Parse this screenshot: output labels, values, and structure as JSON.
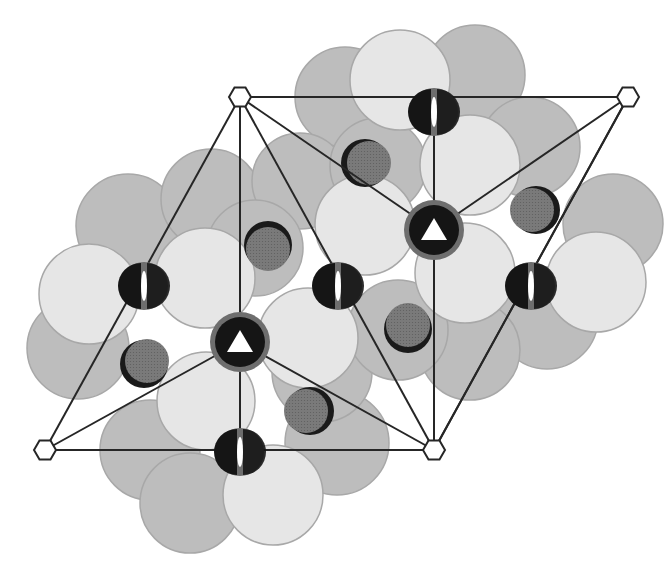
{
  "diagram": {
    "title": "Hexagonal crystal structure projection with symmetry elements",
    "type": "crystal-structure-projection",
    "colors": {
      "background": "#ffffff",
      "large_sphere_light": "#e6e6e6",
      "large_sphere_dark": "#bdbdbd",
      "large_sphere_stroke": "#a8a8a8",
      "medium_sphere": "#7a7a7a",
      "medium_sphere_shadow": "#1a1a1a",
      "axis_disc_outer": "#6e6e6e",
      "axis_disc_inner": "#151515",
      "cell_line": "#262626",
      "symbol_fill": "#ffffff"
    },
    "unit_cell": {
      "vertices": [
        {
          "name": "top-left",
          "x": 240,
          "y": 97
        },
        {
          "name": "top-right",
          "x": 628,
          "y": 97
        },
        {
          "name": "bottom-left",
          "x": 45,
          "y": 450
        },
        {
          "name": "bottom-right",
          "x": 434,
          "y": 450
        }
      ]
    },
    "symmetry_elements": {
      "sixfold_axes": [
        {
          "x": 240,
          "y": 97
        },
        {
          "x": 628,
          "y": 97
        },
        {
          "x": 45,
          "y": 450
        },
        {
          "x": 434,
          "y": 450
        }
      ],
      "threefold_axes": [
        {
          "x": 240,
          "y": 342
        },
        {
          "x": 434,
          "y": 230
        }
      ],
      "twofold_axes": [
        {
          "x": 434,
          "y": 112
        },
        {
          "x": 144,
          "y": 286
        },
        {
          "x": 338,
          "y": 286
        },
        {
          "x": 531,
          "y": 286
        },
        {
          "x": 240,
          "y": 452
        }
      ]
    },
    "large_spheres_dark": [
      {
        "x": 345,
        "y": 97,
        "r": 50
      },
      {
        "x": 475,
        "y": 75,
        "r": 50
      },
      {
        "x": 530,
        "y": 147,
        "r": 50
      },
      {
        "x": 613,
        "y": 224,
        "r": 50
      },
      {
        "x": 547,
        "y": 318,
        "r": 51
      },
      {
        "x": 128,
        "y": 226,
        "r": 52
      },
      {
        "x": 211,
        "y": 199,
        "r": 50
      },
      {
        "x": 300,
        "y": 181,
        "r": 48
      },
      {
        "x": 78,
        "y": 348,
        "r": 51
      },
      {
        "x": 150,
        "y": 450,
        "r": 50
      },
      {
        "x": 190,
        "y": 503,
        "r": 50
      },
      {
        "x": 337,
        "y": 443,
        "r": 52
      },
      {
        "x": 322,
        "y": 372,
        "r": 50
      },
      {
        "x": 470,
        "y": 350,
        "r": 50
      },
      {
        "x": 398,
        "y": 330,
        "r": 50
      },
      {
        "x": 255,
        "y": 248,
        "r": 48
      },
      {
        "x": 378,
        "y": 166,
        "r": 48
      }
    ],
    "large_spheres_light": [
      {
        "x": 400,
        "y": 80,
        "r": 50
      },
      {
        "x": 470,
        "y": 165,
        "r": 50
      },
      {
        "x": 365,
        "y": 225,
        "r": 50
      },
      {
        "x": 465,
        "y": 273,
        "r": 50
      },
      {
        "x": 596,
        "y": 282,
        "r": 50
      },
      {
        "x": 89,
        "y": 294,
        "r": 50
      },
      {
        "x": 205,
        "y": 278,
        "r": 50
      },
      {
        "x": 308,
        "y": 338,
        "r": 50
      },
      {
        "x": 206,
        "y": 401,
        "r": 49
      },
      {
        "x": 273,
        "y": 495,
        "r": 50
      }
    ],
    "medium_spheres": [
      {
        "x": 365,
        "y": 163,
        "r": 24,
        "shadow_side": "left"
      },
      {
        "x": 268,
        "y": 245,
        "r": 24,
        "shadow_side": "top"
      },
      {
        "x": 536,
        "y": 210,
        "r": 24,
        "shadow_side": "right"
      },
      {
        "x": 144,
        "y": 364,
        "r": 24,
        "shadow_side": "left-bottom"
      },
      {
        "x": 408,
        "y": 329,
        "r": 24,
        "shadow_side": "bottom"
      },
      {
        "x": 310,
        "y": 411,
        "r": 24,
        "shadow_side": "right"
      }
    ]
  }
}
